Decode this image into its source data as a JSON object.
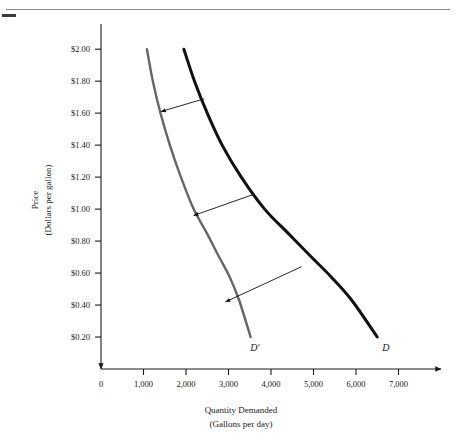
{
  "figure": {
    "background_color": "#ffffff",
    "top_rule_color": "#8a8a8a",
    "corner_dash_color": "#3a3a3a"
  },
  "chart_data": {
    "type": "line",
    "title": "",
    "subtitle": "",
    "xlabel": "Quantity Demanded",
    "xlabel_units": "(Gallons per day)",
    "ylabel": "Price",
    "ylabel_units": "(Dollars per gallon)",
    "xlim": [
      0,
      7600
    ],
    "ylim": [
      0,
      2.12
    ],
    "grid": false,
    "legend": "inline-curve-labels",
    "x_ticks": [
      0,
      1000,
      2000,
      3000,
      4000,
      5000,
      6000,
      7000
    ],
    "x_tick_labels": [
      "0",
      "1,000",
      "2,000",
      "3,000",
      "4,000",
      "5,000",
      "6,000",
      "7,000"
    ],
    "y_ticks": [
      0.2,
      0.4,
      0.6,
      0.8,
      1.0,
      1.2,
      1.4,
      1.6,
      1.8,
      2.0
    ],
    "y_tick_labels": [
      "$0.20",
      "$0.40",
      "$0.60",
      "$0.80",
      "$1.00",
      "$1.20",
      "$1.40",
      "$1.60",
      "$1.80",
      "$2.00"
    ],
    "series": [
      {
        "name": "D",
        "label": "D",
        "color": "#111111",
        "width": 3.0,
        "description": "Original demand curve",
        "points": [
          [
            1950,
            2.0
          ],
          [
            2200,
            1.8
          ],
          [
            2500,
            1.6
          ],
          [
            2850,
            1.4
          ],
          [
            3300,
            1.2
          ],
          [
            3850,
            1.0
          ],
          [
            4400,
            0.85
          ],
          [
            4950,
            0.7
          ],
          [
            5400,
            0.58
          ],
          [
            5900,
            0.43
          ],
          [
            6500,
            0.2
          ]
        ],
        "label_position": [
          6700,
          0.11
        ]
      },
      {
        "name": "D-prime",
        "label": "D′",
        "color": "#666666",
        "width": 2.4,
        "description": "New demand curve after leftward shift",
        "points": [
          [
            1080,
            2.0
          ],
          [
            1220,
            1.8
          ],
          [
            1400,
            1.6
          ],
          [
            1620,
            1.4
          ],
          [
            1880,
            1.2
          ],
          [
            2180,
            1.0
          ],
          [
            2490,
            0.85
          ],
          [
            2780,
            0.7
          ],
          [
            3020,
            0.58
          ],
          [
            3250,
            0.43
          ],
          [
            3520,
            0.2
          ]
        ],
        "label_position": [
          3620,
          0.11
        ]
      }
    ],
    "annotations": [
      {
        "name": "shift-arrow-top",
        "type": "arrow",
        "from": [
          2430,
          1.69
        ],
        "to": [
          1410,
          1.61
        ],
        "color": "#111111",
        "meaning": "demand shifts left at high price"
      },
      {
        "name": "shift-arrow-middle",
        "type": "arrow",
        "from": [
          3570,
          1.09
        ],
        "to": [
          2180,
          0.96
        ],
        "color": "#111111",
        "meaning": "demand shifts left at middle price"
      },
      {
        "name": "shift-arrow-bottom",
        "type": "arrow",
        "from": [
          4720,
          0.64
        ],
        "to": [
          2930,
          0.42
        ],
        "color": "#111111",
        "meaning": "demand shifts left at low price"
      }
    ]
  }
}
